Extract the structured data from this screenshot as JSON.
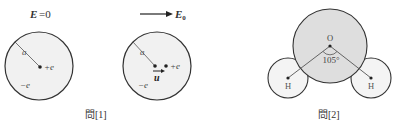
{
  "figure1": {
    "caption": "問[1]",
    "left_panel": {
      "field_label_E": "E",
      "field_label_eq": "=0",
      "radius_label": "a",
      "nucleus_label": "+e",
      "cloud_label": "−e"
    },
    "right_panel": {
      "field_label": "E",
      "field_subscript": "0",
      "radius_label": "a",
      "nucleus_label": "+e",
      "cloud_label": "−e",
      "displacement_label": "u"
    }
  },
  "figure2": {
    "caption": "問[2]",
    "oxygen_label": "O",
    "hydrogen_left_label": "H",
    "hydrogen_right_label": "H",
    "angle_label": "105°"
  },
  "colors": {
    "stroke": "#333333",
    "fill_light": "#f1f1f1",
    "fill_oxygen": "#dedede",
    "fill_hydrogen": "#f4f4f4",
    "text": "#333333"
  }
}
